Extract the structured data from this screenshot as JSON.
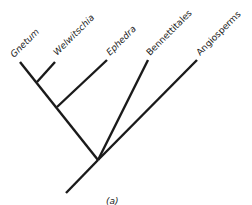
{
  "figure": {
    "caption": "(a)",
    "type": "cladogram",
    "taxa": [
      {
        "name": "Gnetum",
        "italic": true
      },
      {
        "name": "Welwitschia",
        "italic": true
      },
      {
        "name": "Ephedra",
        "italic": true
      },
      {
        "name": "Bennettitales",
        "italic": false
      },
      {
        "name": "Angiosperms",
        "italic": false
      }
    ],
    "topology": "(((Gnetum, Welwitschia), Ephedra), Bennettitales, Angiosperms)"
  }
}
